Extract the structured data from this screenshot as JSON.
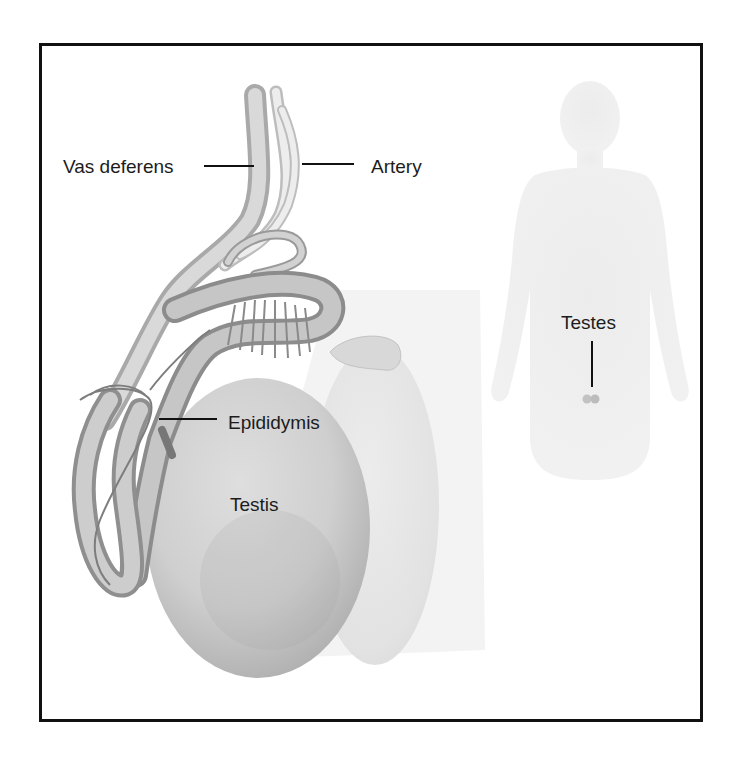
{
  "figure": {
    "type": "anatomical-illustration",
    "labels": {
      "vas_deferens": "Vas deferens",
      "artery": "Artery",
      "epididymis": "Epididymis",
      "testis": "Testis",
      "testes": "Testes"
    },
    "inset": {
      "description": "Human body silhouette showing testes location",
      "label": "Testes"
    },
    "colors": {
      "border": "#111111",
      "text": "#1c1c1c",
      "tissue_light": "#dcdcdc",
      "tissue_mid": "#b8b8b8",
      "tissue_dark": "#8a8a8a",
      "silhouette": "#ececec",
      "testes_dot": "#bdbdbd"
    }
  }
}
